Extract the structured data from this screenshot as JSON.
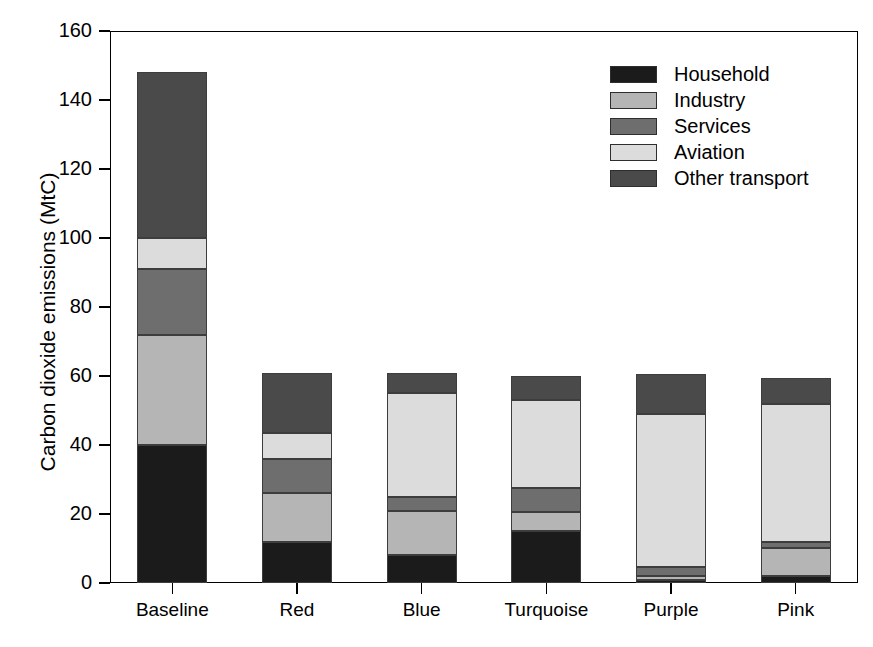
{
  "chart_data": {
    "type": "bar",
    "subtype": "stacked-bar",
    "title": "",
    "xlabel": "",
    "ylabel": "Carbon dioxide emissions (MtC)",
    "ylim": [
      0,
      160
    ],
    "yticks": [
      0,
      20,
      40,
      60,
      80,
      100,
      120,
      140,
      160
    ],
    "grid": false,
    "legend_position": "top-right-inside",
    "categories": [
      "Baseline",
      "Red",
      "Blue",
      "Turquoise",
      "Purple",
      "Pink"
    ],
    "series": [
      {
        "name": "Household",
        "color": "#1b1b1b",
        "values": [
          40,
          12,
          8,
          15,
          1,
          2
        ]
      },
      {
        "name": "Industry",
        "color": "#b5b5b5",
        "values": [
          32,
          14,
          13,
          5.5,
          1,
          8
        ]
      },
      {
        "name": "Services",
        "color": "#6e6e6e",
        "values": [
          19,
          10,
          4,
          7,
          2.5,
          2
        ]
      },
      {
        "name": "Aviation",
        "color": "#dcdcdc",
        "values": [
          9,
          7.5,
          30,
          25.5,
          44.5,
          40
        ]
      },
      {
        "name": "Other transport",
        "color": "#4a4a4a",
        "values": [
          48,
          17.5,
          6,
          7,
          11.5,
          7.5
        ]
      }
    ],
    "totals": [
      148,
      61,
      61,
      60,
      60.5,
      59.5
    ]
  },
  "axis": {
    "y_title": "Carbon dioxide emissions (MtC)",
    "y_tick_labels": [
      "0",
      "20",
      "40",
      "60",
      "80",
      "100",
      "120",
      "140",
      "160"
    ],
    "x_tick_labels": [
      "Baseline",
      "Red",
      "Blue",
      "Turquoise",
      "Purple",
      "Pink"
    ]
  },
  "legend": {
    "entries": [
      {
        "label": "Household",
        "color": "#1b1b1b"
      },
      {
        "label": "Industry",
        "color": "#b5b5b5"
      },
      {
        "label": "Services",
        "color": "#6e6e6e"
      },
      {
        "label": "Aviation",
        "color": "#dcdcdc"
      },
      {
        "label": "Other transport",
        "color": "#4a4a4a"
      }
    ]
  }
}
